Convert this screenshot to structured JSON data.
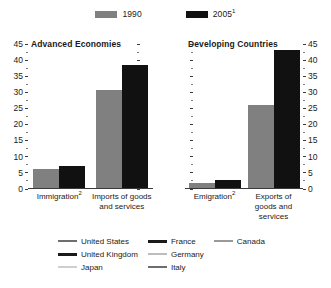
{
  "series_legend": {
    "items": [
      {
        "label": "1990",
        "sup": "",
        "color": "#808080",
        "swatch_name": "legend-swatch-1990"
      },
      {
        "label": "2005",
        "sup": "1",
        "color": "#111111",
        "swatch_name": "legend-swatch-2005"
      }
    ]
  },
  "axis": {
    "ticks": [
      0,
      5,
      10,
      15,
      20,
      25,
      30,
      35,
      40,
      45
    ],
    "min": 0,
    "max": 45,
    "minor_step": 2.5
  },
  "panels": [
    {
      "title": "Advanced Economies",
      "categories": [
        {
          "label": "Immigration",
          "sup": "2"
        },
        {
          "label": "Imports of goods and services",
          "sup": ""
        }
      ]
    },
    {
      "title": "Developing Countries",
      "categories": [
        {
          "label": "Emigration",
          "sup": "2"
        },
        {
          "label": "Exports of goods and services",
          "sup": ""
        }
      ]
    }
  ],
  "country_legend": {
    "columns": [
      [
        {
          "label": "United States",
          "color": "#6e6e6e",
          "thickness": 2
        },
        {
          "label": "United Kingdom",
          "color": "#1a1a1a",
          "thickness": 3
        },
        {
          "label": "Japan",
          "color": "#cfcfcf",
          "thickness": 2
        }
      ],
      [
        {
          "label": "France",
          "color": "#1a1a1a",
          "thickness": 3
        },
        {
          "label": "Germany",
          "color": "#bdbdbd",
          "thickness": 2
        },
        {
          "label": "Italy",
          "color": "#6e6e6e",
          "thickness": 2
        }
      ],
      [
        {
          "label": "Canada",
          "color": "#9a9a9a",
          "thickness": 2
        }
      ]
    ]
  },
  "chart_data": [
    {
      "type": "bar",
      "title": "Advanced Economies",
      "categories": [
        "Immigration2",
        "Imports of goods and services"
      ],
      "series": [
        {
          "name": "1990",
          "color": "#808080",
          "values": [
            6,
            30.5
          ]
        },
        {
          "name": "20051",
          "color": "#111111",
          "values": [
            7,
            38.5
          ]
        }
      ],
      "xlabel": "",
      "ylabel": "",
      "ylim": [
        0,
        45
      ],
      "yticks": [
        0,
        5,
        10,
        15,
        20,
        25,
        30,
        35,
        40,
        45
      ],
      "grid": false,
      "legend_position": "top"
    },
    {
      "type": "bar",
      "title": "Developing Countries",
      "categories": [
        "Emigration2",
        "Exports of goods and services"
      ],
      "series": [
        {
          "name": "1990",
          "color": "#808080",
          "values": [
            1.5,
            26
          ]
        },
        {
          "name": "20051",
          "color": "#111111",
          "values": [
            2.5,
            43
          ]
        }
      ],
      "xlabel": "",
      "ylabel": "",
      "ylim": [
        0,
        45
      ],
      "yticks": [
        0,
        5,
        10,
        15,
        20,
        25,
        30,
        35,
        40,
        45
      ],
      "grid": false,
      "legend_position": "top"
    }
  ]
}
